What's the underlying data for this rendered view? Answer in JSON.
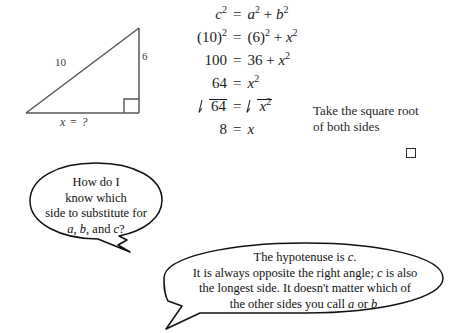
{
  "figure": {
    "name": "right-triangle-diagram",
    "hypotenuse_label": "10",
    "vertical_label": "6",
    "base_label_text": "x  =  ?",
    "base_label_var": "x",
    "base_label_rest": "=  ?",
    "right_angle_marker": "right-angle-square"
  },
  "equations": [
    {
      "lhs_base": "c",
      "lhs_sup": "2",
      "op": "=",
      "rhs": "a² + b²"
    },
    {
      "lhs_base": "(10)",
      "lhs_sup": "2",
      "op": "=",
      "rhs": "(6)² + x²"
    },
    {
      "lhs_base": "100",
      "lhs_sup": "",
      "op": "=",
      "rhs": "36 + x²"
    },
    {
      "lhs_base": "64",
      "lhs_sup": "",
      "op": "=",
      "rhs": "x²"
    },
    {
      "lhs_base": "√64",
      "lhs_sup": "",
      "op": "=",
      "rhs": "√x²"
    },
    {
      "lhs_base": "8",
      "lhs_sup": "",
      "op": "=",
      "rhs": "x"
    }
  ],
  "eq_parts": {
    "row1_lhs": "c",
    "row1_rhs_a": "a",
    "row1_rhs_plus": "+",
    "row1_rhs_b": "b",
    "row2_lhs": "(10)",
    "row2_rhs_6": "(6)",
    "row2_rhs_plus": "+",
    "row2_rhs_x": "x",
    "row3_lhs": "100",
    "row3_rhs_36": "36",
    "row3_rhs_plus": "+",
    "row3_rhs_x": "x",
    "row4_lhs": "64",
    "row4_rhs_x": "x",
    "row5_lhs": "64",
    "row5_rhs_x": "x",
    "row6_lhs": "8",
    "row6_rhs_x": "x",
    "equals": "=",
    "exp2": "2"
  },
  "sidenote": {
    "line1": "Take the square root",
    "line2": "of both sides"
  },
  "bubble_one": {
    "line1": "How do I",
    "line2": "know which",
    "line3": "side to substitute for",
    "line4_a": "a",
    "line4_sep1": ", ",
    "line4_b": "b",
    "line4_sep2": ", and ",
    "line4_c": "c",
    "line4_end": "?"
  },
  "bubble_two": {
    "line1_pre": "The hypotenuse is ",
    "line1_var": "c",
    "line1_end": ".",
    "line2_pre": "It is always opposite the right angle; ",
    "line2_var": "c",
    "line2_end": " is also",
    "line3": "the longest side. It doesn't matter which of",
    "line4_pre": "the other sides you call ",
    "line4_a": "a",
    "line4_mid": " or ",
    "line4_b": "b",
    "line4_end": "."
  },
  "colors": {
    "ink": "#1a1a1a",
    "figure_stroke": "#55565a",
    "background": "#ffffff"
  }
}
